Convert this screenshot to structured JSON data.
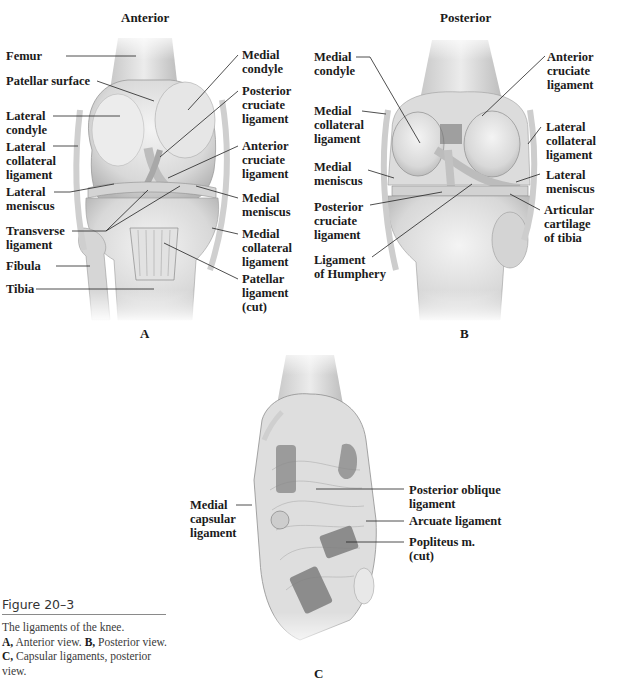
{
  "figure": {
    "number": "Figure 20–3",
    "caption": {
      "line1": "The ligaments of the knee.",
      "a_key": "A,",
      "a_text": " Anterior view. ",
      "b_key": "B,",
      "b_text": " Posterior view. ",
      "c_key": "C,",
      "c_text": " Capsular ligaments, posterior view."
    }
  },
  "panels": {
    "A": {
      "letter": "A",
      "title": "Anterior",
      "labels": {
        "femur": "Femur",
        "patellar_surface": "Patellar surface",
        "lateral_condyle": "Lateral\ncondyle",
        "lateral_collateral_ligament": "Lateral\ncollateral\nligament",
        "lateral_meniscus": "Lateral\nmeniscus",
        "transverse_ligament": "Transverse\nligament",
        "fibula": "Fibula",
        "tibia": "Tibia",
        "medial_condyle": "Medial\ncondyle",
        "posterior_cruciate_ligament": "Posterior\ncruciate\nligament",
        "anterior_cruciate_ligament": "Anterior\ncruciate\nligament",
        "medial_meniscus": "Medial\nmeniscus",
        "medial_collateral_ligament": "Medial\ncollateral\nligament",
        "patellar_ligament_cut": "Patellar\nligament\n(cut)"
      }
    },
    "B": {
      "letter": "B",
      "title": "Posterior",
      "labels": {
        "medial_condyle": "Medial\ncondyle",
        "medial_collateral_ligament": "Medial\ncollateral\nligament",
        "medial_meniscus": "Medial\nmeniscus",
        "posterior_cruciate_ligament": "Posterior\ncruciate\nligament",
        "ligament_of_humphery": "Ligament\nof Humphery",
        "anterior_cruciate_ligament": "Anterior\ncruciate\nligament",
        "lateral_collateral_ligament": "Lateral\ncollateral\nligament",
        "lateral_meniscus": "Lateral\nmeniscus",
        "articular_cartilage_of_tibia": "Articular\ncartilage\nof tibia"
      }
    },
    "C": {
      "letter": "C",
      "labels": {
        "medial_capsular_ligament": "Medial\ncapsular\nligament",
        "posterior_oblique_ligament": "Posterior oblique\nligament",
        "arcuate_ligament": "Arcuate ligament",
        "popliteus_cut": "Popliteus m.\n(cut)"
      }
    }
  }
}
